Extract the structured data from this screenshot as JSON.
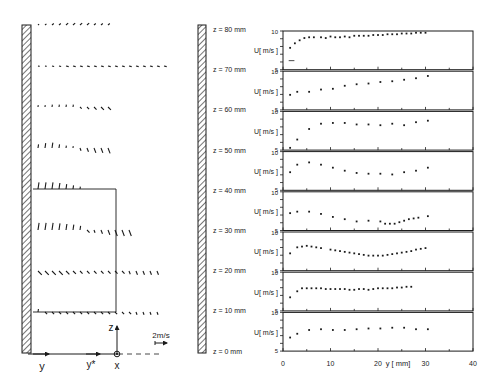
{
  "left_figure": {
    "axis_labels": {
      "y": "y",
      "y_star": "y*",
      "z": "z",
      "x": "x"
    },
    "scale_label": "2m/s",
    "rows": [
      {
        "z_mm": 80,
        "vectors": [
          [
            0,
            0.3,
            "d"
          ],
          [
            1,
            0.4,
            "d"
          ],
          [
            2,
            0.5,
            "d"
          ],
          [
            3,
            0.5,
            "d"
          ],
          [
            4,
            0.6,
            "d"
          ],
          [
            5,
            0.6,
            "d"
          ],
          [
            6,
            0.6,
            "d"
          ],
          [
            7,
            0.6,
            "d"
          ],
          [
            8,
            0.5,
            "d"
          ],
          [
            9,
            0.5,
            "d"
          ],
          [
            10,
            0.5,
            "d"
          ]
        ]
      },
      {
        "z_mm": 70,
        "vectors": [
          [
            0,
            0.3,
            "h"
          ],
          [
            1,
            0.3,
            "h"
          ],
          [
            2,
            0.4,
            "h"
          ],
          [
            3,
            0.4,
            "h"
          ],
          [
            4,
            0.5,
            "h"
          ],
          [
            5,
            0.5,
            "h"
          ],
          [
            6,
            0.5,
            "h"
          ],
          [
            7,
            0.5,
            "h"
          ],
          [
            8,
            0.5,
            "h"
          ],
          [
            9,
            0.5,
            "h"
          ],
          [
            10,
            0.5,
            "h"
          ],
          [
            11,
            0.5,
            "h"
          ],
          [
            12,
            0.5,
            "h"
          ],
          [
            13,
            0.5,
            "h"
          ],
          [
            14,
            0.5,
            "h"
          ],
          [
            15,
            0.5,
            "h"
          ],
          [
            16,
            0.5,
            "h"
          ],
          [
            17,
            0.5,
            "h"
          ],
          [
            18,
            0.5,
            "h"
          ]
        ]
      },
      {
        "z_mm": 60,
        "vectors": [
          [
            0,
            0.3,
            "u"
          ],
          [
            1,
            0.3,
            "u"
          ],
          [
            2,
            0.4,
            "u"
          ],
          [
            3,
            0.4,
            "u"
          ],
          [
            4,
            0.4,
            "u"
          ],
          [
            5,
            0.4,
            "u"
          ],
          [
            6,
            0.4,
            "n"
          ],
          [
            7,
            0.5,
            "n"
          ],
          [
            8,
            0.6,
            "n"
          ],
          [
            9,
            0.7,
            "n"
          ],
          [
            10,
            0.7,
            "n"
          ]
        ]
      },
      {
        "z_mm": 50,
        "vectors": [
          [
            0,
            0.6,
            "u"
          ],
          [
            1,
            0.8,
            "u"
          ],
          [
            2,
            0.9,
            "u"
          ],
          [
            3,
            0.6,
            "u"
          ],
          [
            4,
            0.4,
            "u"
          ],
          [
            5,
            0.3,
            "u"
          ],
          [
            6,
            0.5,
            "d"
          ],
          [
            7,
            0.7,
            "d"
          ],
          [
            8,
            0.9,
            "d"
          ],
          [
            9,
            0.9,
            "d"
          ],
          [
            10,
            1.0,
            "d"
          ]
        ]
      },
      {
        "z_mm": 40,
        "vectors": [
          [
            0,
            1.1,
            "u"
          ],
          [
            1,
            1.1,
            "u"
          ],
          [
            2,
            1.1,
            "u"
          ],
          [
            3,
            1.0,
            "u"
          ],
          [
            4,
            0.8,
            "u"
          ],
          [
            5,
            0.6,
            "u"
          ],
          [
            6,
            0.4,
            "u"
          ]
        ]
      },
      {
        "z_mm": 30,
        "vectors": [
          [
            0,
            1.2,
            "u"
          ],
          [
            1,
            1.2,
            "u"
          ],
          [
            2,
            1.2,
            "u"
          ],
          [
            3,
            1.1,
            "u"
          ],
          [
            4,
            1.0,
            "u"
          ],
          [
            5,
            0.9,
            "u"
          ],
          [
            6,
            0.7,
            "u"
          ],
          [
            7,
            0.6,
            "n"
          ],
          [
            8,
            0.5,
            "d"
          ],
          [
            9,
            0.7,
            "d"
          ],
          [
            10,
            0.9,
            "d"
          ],
          [
            11,
            1.1,
            "d"
          ],
          [
            12,
            1.1,
            "d"
          ],
          [
            13,
            1.1,
            "d"
          ]
        ]
      },
      {
        "z_mm": 20,
        "vectors": [
          [
            0,
            0.9,
            "n"
          ],
          [
            1,
            0.9,
            "n"
          ],
          [
            2,
            0.9,
            "n"
          ],
          [
            3,
            0.9,
            "n"
          ],
          [
            4,
            0.8,
            "n"
          ],
          [
            5,
            0.7,
            "n"
          ],
          [
            6,
            0.6,
            "n"
          ],
          [
            7,
            0.6,
            "n"
          ],
          [
            8,
            0.6,
            "n"
          ],
          [
            9,
            0.6,
            "n"
          ],
          [
            10,
            0.6,
            "n"
          ],
          [
            11,
            0.6,
            "n"
          ],
          [
            12,
            0.6,
            "n"
          ],
          [
            13,
            0.6,
            "d"
          ],
          [
            14,
            0.7,
            "d"
          ],
          [
            15,
            0.7,
            "d"
          ],
          [
            16,
            0.7,
            "d"
          ],
          [
            17,
            0.7,
            "d"
          ]
        ]
      },
      {
        "z_mm": 10,
        "vectors": [
          [
            0,
            0.5,
            "u"
          ],
          [
            1,
            0.5,
            "n"
          ],
          [
            2,
            0.5,
            "n"
          ],
          [
            3,
            0.5,
            "n"
          ],
          [
            4,
            0.5,
            "n"
          ],
          [
            5,
            0.5,
            "n"
          ],
          [
            6,
            0.5,
            "n"
          ],
          [
            7,
            0.5,
            "n"
          ],
          [
            8,
            0.5,
            "n"
          ],
          [
            9,
            0.5,
            "n"
          ],
          [
            10,
            0.5,
            "n"
          ],
          [
            11,
            0.5,
            "n"
          ],
          [
            12,
            0.5,
            "n"
          ],
          [
            13,
            0.5,
            "n"
          ],
          [
            14,
            0.5,
            "d"
          ],
          [
            15,
            0.5,
            "d"
          ],
          [
            16,
            0.5,
            "d"
          ],
          [
            17,
            0.5,
            "d"
          ]
        ]
      }
    ]
  },
  "chart_data": {
    "type": "scatter",
    "title": "",
    "xlabel": "y [ mm]",
    "ylabel": "U[ m/s ]",
    "xlim": [
      0,
      40
    ],
    "ylim": [
      5,
      10
    ],
    "x_ticks": [
      0,
      10,
      20,
      30,
      40
    ],
    "y_ticks": [
      5,
      10
    ],
    "grid": false,
    "legend": "none",
    "series": [
      {
        "name": "z = 80 mm",
        "x": [
          1.5,
          2.5,
          3.5,
          4.5,
          5.5,
          6.5,
          8,
          9,
          10,
          11,
          12,
          13,
          14,
          15,
          16,
          17,
          18,
          19,
          20,
          21,
          22,
          23,
          24,
          25,
          26,
          27,
          28,
          29,
          30
        ],
        "y": [
          7.9,
          8.5,
          8.9,
          9.2,
          9.3,
          9.3,
          9.3,
          9.2,
          9.4,
          9.3,
          9.3,
          9.4,
          9.3,
          9.5,
          9.5,
          9.5,
          9.5,
          9.6,
          9.6,
          9.6,
          9.7,
          9.7,
          9.7,
          9.8,
          9.8,
          9.8,
          9.9,
          9.9,
          9.9
        ]
      },
      {
        "name": "z = 70 mm",
        "x": [
          1.5,
          3,
          5.5,
          8,
          10.5,
          13,
          15.5,
          18,
          20.5,
          23,
          25.5,
          28,
          30.5
        ],
        "y": [
          7.0,
          7.4,
          7.4,
          7.7,
          7.8,
          8.2,
          8.4,
          8.5,
          8.7,
          8.8,
          9.0,
          9.2,
          9.5
        ]
      },
      {
        "name": "z = 60 mm",
        "x": [
          1.5,
          3,
          5.5,
          8,
          10.5,
          13,
          15.5,
          18,
          20.5,
          23,
          25.5,
          28,
          30.5
        ],
        "y": [
          5.3,
          6.4,
          7.8,
          8.5,
          8.6,
          8.6,
          8.4,
          8.4,
          8.3,
          8.5,
          8.3,
          8.7,
          8.9
        ]
      },
      {
        "name": "z = 50 mm",
        "x": [
          1.5,
          3,
          5.5,
          8,
          10.5,
          13,
          15.5,
          18,
          20.5,
          23,
          25.5,
          28,
          30.5
        ],
        "y": [
          7.4,
          8.4,
          8.7,
          8.4,
          8.0,
          7.6,
          7.3,
          7.2,
          7.2,
          7.1,
          7.4,
          7.6,
          8.0
        ]
      },
      {
        "name": "z = 40 mm",
        "x": [
          1.5,
          3,
          5.5,
          8,
          10.5,
          13,
          15.5,
          18,
          20.5,
          21.5,
          22.5,
          23.5,
          24.5,
          25.5,
          26.5,
          27.5,
          28.5,
          30.5
        ],
        "y": [
          7.3,
          7.5,
          7.5,
          7.2,
          6.8,
          6.5,
          6.2,
          6.3,
          6.2,
          5.9,
          5.9,
          5.9,
          6.1,
          6.3,
          6.5,
          6.6,
          6.7,
          6.9
        ]
      },
      {
        "name": "z = 30 mm",
        "x": [
          1.5,
          3,
          4,
          5,
          6,
          7,
          8,
          10,
          11,
          12,
          13,
          14,
          15,
          16,
          17,
          18,
          19,
          20,
          21,
          22,
          23,
          24,
          25,
          26,
          27,
          28,
          29,
          30
        ],
        "y": [
          7.3,
          8.1,
          8.2,
          8.3,
          8.2,
          8.1,
          8.0,
          7.8,
          7.7,
          7.6,
          7.5,
          7.4,
          7.3,
          7.2,
          7.1,
          7.0,
          7.0,
          7.0,
          7.0,
          7.1,
          7.2,
          7.3,
          7.4,
          7.5,
          7.6,
          7.8,
          7.9,
          8.0
        ]
      },
      {
        "name": "z = 20 mm",
        "x": [
          1.5,
          3,
          4,
          5,
          6,
          7,
          8,
          9,
          10,
          11,
          12,
          13,
          14,
          15,
          16,
          17,
          18,
          19,
          20,
          21,
          22,
          23,
          24,
          25,
          26,
          27
        ],
        "y": [
          6.8,
          7.6,
          8.0,
          8.0,
          8.0,
          8.0,
          8.0,
          7.9,
          7.9,
          7.9,
          7.9,
          7.9,
          7.8,
          7.8,
          7.9,
          7.9,
          7.8,
          7.9,
          8.0,
          8.0,
          8.0,
          8.0,
          8.1,
          8.1,
          8.2,
          8.2
        ]
      },
      {
        "name": "z = 10 mm",
        "x": [
          1.5,
          3,
          5.5,
          8,
          10.5,
          13,
          15.5,
          18,
          20.5,
          23,
          25.5,
          28,
          30.5
        ],
        "y": [
          6.8,
          7.3,
          7.8,
          7.9,
          7.8,
          7.8,
          7.9,
          8.0,
          8.0,
          8.1,
          8.1,
          7.9,
          7.9
        ]
      }
    ],
    "extra_marks": [
      {
        "panel": "z = 80 mm",
        "type": "short-dash",
        "x": [
          1.2,
          2.4
        ],
        "y": 6.2
      }
    ]
  },
  "right_figure": {
    "ylabel": "U[ m/s ]",
    "xlabel": "y [ mm]",
    "x_tick_labels": [
      "0",
      "10",
      "20",
      "30",
      "40"
    ],
    "y_tick_top": "10",
    "y_tick_bottom": "5",
    "panel_labels": [
      "z = 80 mm",
      "z = 70 mm",
      "z = 60 mm",
      "z = 50 mm",
      "z = 40 mm",
      "z = 30 mm",
      "z = 20 mm",
      "z = 10 mm",
      "z = 0 mm"
    ]
  },
  "colors": {
    "ink": "#1a1a1a",
    "background": "#ffffff"
  }
}
